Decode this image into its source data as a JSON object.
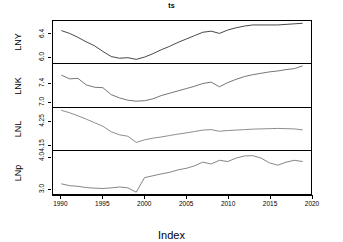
{
  "chart_data": {
    "type": "line",
    "title": "ts",
    "xlabel": "Index",
    "ylabel": "",
    "grid": false,
    "legend": "none",
    "layout": "4 stacked panels sharing a common x axis (R plot.ts multivariate)",
    "xlim": [
      1989,
      2020
    ],
    "x_ticks": [
      "1990",
      "1995",
      "2000",
      "2005",
      "2010",
      "2015",
      "2020"
    ],
    "x": [
      1990,
      1991,
      1992,
      1993,
      1994,
      1995,
      1996,
      1997,
      1998,
      1999,
      2000,
      2001,
      2002,
      2003,
      2004,
      2005,
      2006,
      2007,
      2008,
      2009,
      2010,
      2011,
      2012,
      2013,
      2014,
      2015,
      2016,
      2017,
      2018,
      2019
    ],
    "panels": [
      {
        "name": "LNY",
        "label": "LNY",
        "y_ticks": [
          "6.4",
          "6.0"
        ],
        "y_tick_values": [
          6.4,
          6.0
        ],
        "ylim": [
          5.88,
          6.62
        ],
        "color": "#333333",
        "values": [
          6.45,
          6.4,
          6.33,
          6.25,
          6.18,
          6.08,
          5.99,
          5.96,
          5.97,
          5.94,
          5.98,
          6.04,
          6.11,
          6.17,
          6.24,
          6.3,
          6.36,
          6.42,
          6.44,
          6.4,
          6.46,
          6.5,
          6.53,
          6.55,
          6.55,
          6.55,
          6.55,
          6.56,
          6.57,
          6.58
        ]
      },
      {
        "name": "LNK",
        "label": "LNK",
        "y_ticks": [
          "7.4",
          "7.0"
        ],
        "y_tick_values": [
          7.4,
          7.0
        ],
        "ylim": [
          6.88,
          7.8
        ],
        "color": "#666666",
        "values": [
          7.56,
          7.48,
          7.49,
          7.35,
          7.3,
          7.29,
          7.14,
          7.07,
          7.02,
          7.0,
          7.01,
          7.05,
          7.12,
          7.17,
          7.22,
          7.27,
          7.32,
          7.38,
          7.41,
          7.31,
          7.4,
          7.47,
          7.53,
          7.57,
          7.6,
          7.63,
          7.65,
          7.68,
          7.7,
          7.76
        ]
      },
      {
        "name": "LNL",
        "label": "LNL",
        "y_ticks": [
          "4.25",
          "4.15"
        ],
        "y_tick_values": [
          4.25,
          4.15
        ],
        "ylim": [
          4.125,
          4.305
        ],
        "color": "#808080",
        "values": [
          4.295,
          4.285,
          4.272,
          4.258,
          4.243,
          4.228,
          4.205,
          4.192,
          4.186,
          4.16,
          4.171,
          4.178,
          4.183,
          4.189,
          4.195,
          4.2,
          4.206,
          4.212,
          4.214,
          4.207,
          4.21,
          4.212,
          4.214,
          4.216,
          4.217,
          4.218,
          4.219,
          4.218,
          4.217,
          4.213
        ]
      },
      {
        "name": "LNp",
        "label": "LNp",
        "y_ticks": [
          "4.0",
          "3.0"
        ],
        "y_tick_values": [
          4.0,
          3.0
        ],
        "ylim": [
          2.8,
          4.18
        ],
        "color": "#777777",
        "values": [
          3.12,
          3.06,
          3.04,
          3.0,
          2.98,
          2.97,
          2.99,
          3.02,
          2.99,
          2.85,
          3.32,
          3.38,
          3.44,
          3.49,
          3.57,
          3.62,
          3.7,
          3.82,
          3.76,
          3.88,
          3.84,
          3.95,
          4.02,
          4.03,
          3.95,
          3.8,
          3.72,
          3.82,
          3.88,
          3.84
        ]
      }
    ]
  }
}
